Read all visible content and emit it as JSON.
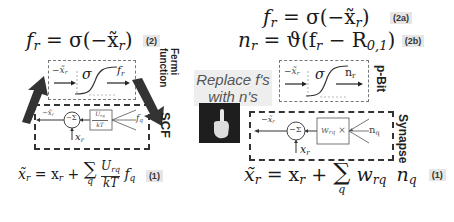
{
  "left_panel": {
    "eq2": {
      "lhs": "f",
      "lhs_sub": "r",
      "rhs": " = σ(−x̃",
      "rhs_sub": "r",
      "close": ")",
      "tag": "(2)"
    },
    "fermi_label": "Fermi function",
    "fermi_block": {
      "input": "−x̃",
      "input_sub": "r",
      "sigma": "σ",
      "output": "f",
      "output_sub": "r"
    },
    "scf_label": "SCF",
    "scf_block": {
      "out": "−x̃",
      "out_sub": "r",
      "sum": "−Σ",
      "x_in": "x",
      "x_in_sub": "r",
      "weight_num": "U",
      "weight_num_sub": "rq",
      "weight_den": "kT",
      "times": "×",
      "input": "f",
      "input_sub": "q"
    },
    "eq1": {
      "lhs": "x̃",
      "lhs_sub": "r",
      "mid": " = x",
      "mid_sub": "r",
      "plus": " + ",
      "sum": "∑",
      "sum_index": "q",
      "frac_num": "U",
      "frac_num_sub": "rq",
      "frac_den": "kT",
      "term": "f",
      "term_sub": "q",
      "tag": "(1)"
    }
  },
  "center": {
    "replace_line1": "Replace f's",
    "replace_line2": "with n's",
    "image": "pointing-hand"
  },
  "right_panel": {
    "eq2a": {
      "lhs": "f",
      "lhs_sub": "r",
      "rhs": " = σ(−x̃",
      "rhs_sub": "r",
      "close": ")",
      "tag": "(2a)"
    },
    "eq2b": {
      "lhs": "n",
      "lhs_sub": "r",
      "rhs": " = ϑ(f",
      "rhs_sub": "r",
      "rhs2": " − R",
      "rhs2_sub": "0,1",
      "close": ")",
      "tag": "(2b)"
    },
    "pbit_label": "p-Bit",
    "pbit_block": {
      "input": "−x̃",
      "input_sub": "r",
      "sigma": "σ",
      "output": "n",
      "output_sub": "r"
    },
    "synapse_label": "Synapse",
    "synapse_block": {
      "out": "−x̃",
      "out_sub": "r",
      "sum": "−Σ",
      "x_in": "x",
      "x_in_sub": "r",
      "weight": "w",
      "weight_sub": "rq",
      "times": " ×",
      "input": "n",
      "input_sub": "q"
    },
    "eq1": {
      "lhs": "x̃",
      "lhs_sub": "r",
      "mid": " = x",
      "mid_sub": "r",
      "plus": " + ",
      "sum": "∑",
      "sum_index": "q",
      "w": "w",
      "w_sub": "rq",
      "term": "n",
      "term_sub": "q",
      "tag": "(1)"
    }
  }
}
